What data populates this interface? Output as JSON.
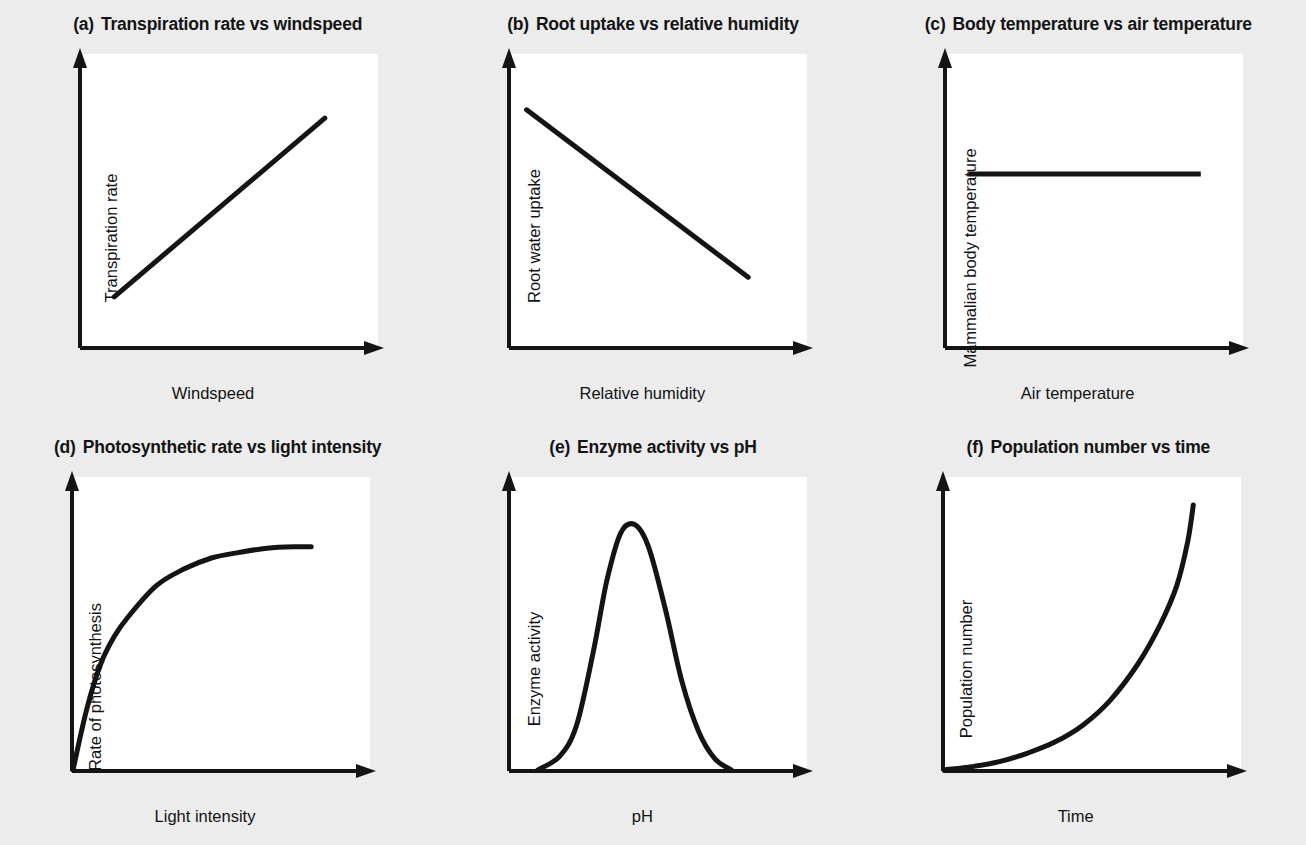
{
  "figure": {
    "background_color": "#ececed",
    "plot_background_color": "#ffffff",
    "ink_color": "#141414",
    "rows": 2,
    "columns": 3
  },
  "chart_data": [
    {
      "type": "line",
      "panel": "a",
      "tag": "(a)",
      "title": "Transpiration rate vs windspeed",
      "xlabel": "Windspeed",
      "ylabel": "Transpiration rate",
      "grid": false,
      "legend": "none",
      "axis_ticks": false,
      "relationship": "positive linear",
      "x": [
        0.12,
        0.88
      ],
      "y": [
        0.18,
        0.82
      ],
      "xlim": [
        0,
        1
      ],
      "ylim": [
        0,
        1
      ]
    },
    {
      "type": "line",
      "panel": "b",
      "tag": "(b)",
      "title": "Root uptake vs relative humidity",
      "xlabel": "Relative humidity",
      "ylabel": "Root water uptake",
      "grid": false,
      "legend": "none",
      "axis_ticks": false,
      "relationship": "negative linear",
      "x": [
        0.06,
        0.86
      ],
      "y": [
        0.85,
        0.25
      ],
      "xlim": [
        0,
        1
      ],
      "ylim": [
        0,
        1
      ]
    },
    {
      "type": "line",
      "panel": "c",
      "tag": "(c)",
      "title": "Body temperature vs air temperature",
      "xlabel": "Air temperature",
      "ylabel": "Mammalian body temperature",
      "grid": false,
      "legend": "none",
      "axis_ticks": false,
      "relationship": "constant / no change",
      "x": [
        0.08,
        0.92
      ],
      "y": [
        0.62,
        0.62
      ],
      "xlim": [
        0,
        1
      ],
      "ylim": [
        0,
        1
      ]
    },
    {
      "type": "line",
      "panel": "d",
      "tag": "(d)",
      "title": "Photosynthetic rate vs light intensity",
      "xlabel": "Light intensity",
      "ylabel": "Rate of photosynthesis",
      "grid": false,
      "legend": "none",
      "axis_ticks": false,
      "relationship": "rising to a plateau (saturation)",
      "x": [
        0.0,
        0.05,
        0.1,
        0.15,
        0.2,
        0.3,
        0.4,
        0.5,
        0.6,
        0.7,
        0.8,
        0.86
      ],
      "y": [
        0.0,
        0.22,
        0.38,
        0.48,
        0.55,
        0.66,
        0.72,
        0.76,
        0.78,
        0.795,
        0.8,
        0.8
      ],
      "xlim": [
        0,
        1
      ],
      "ylim": [
        0,
        1
      ]
    },
    {
      "type": "line",
      "panel": "e",
      "tag": "(e)",
      "title": "Enzyme activity vs pH",
      "xlabel": "pH",
      "ylabel": "Enzyme activity",
      "grid": false,
      "legend": "none",
      "axis_ticks": false,
      "relationship": "bell-shaped optimum",
      "x": [
        0.1,
        0.18,
        0.24,
        0.3,
        0.35,
        0.4,
        0.45,
        0.5,
        0.56,
        0.62,
        0.68,
        0.74,
        0.8
      ],
      "y": [
        0.0,
        0.05,
        0.16,
        0.42,
        0.68,
        0.85,
        0.88,
        0.8,
        0.58,
        0.32,
        0.14,
        0.04,
        0.0
      ],
      "xlim": [
        0,
        1
      ],
      "ylim": [
        0,
        1
      ]
    },
    {
      "type": "line",
      "panel": "f",
      "tag": "(f)",
      "title": "Population number vs time",
      "xlabel": "Time",
      "ylabel": "Population number",
      "grid": false,
      "legend": "none",
      "axis_ticks": false,
      "relationship": "exponential growth",
      "x": [
        0.0,
        0.1,
        0.2,
        0.3,
        0.4,
        0.5,
        0.6,
        0.7,
        0.78,
        0.84,
        0.88,
        0.9
      ],
      "y": [
        0.0,
        0.012,
        0.03,
        0.06,
        0.1,
        0.16,
        0.25,
        0.38,
        0.52,
        0.66,
        0.82,
        0.95
      ],
      "xlim": [
        0,
        1
      ],
      "ylim": [
        0,
        1
      ]
    }
  ]
}
